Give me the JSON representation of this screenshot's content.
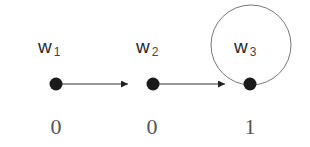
{
  "diagram": {
    "type": "kripke-frame",
    "worlds": [
      {
        "id": "w1",
        "base": "w",
        "sub": "1",
        "value": "0",
        "x": 56,
        "y": 84
      },
      {
        "id": "w2",
        "base": "w",
        "sub": "2",
        "value": "0",
        "x": 153,
        "y": 84
      },
      {
        "id": "w3",
        "base": "w",
        "sub": "3",
        "value": "1",
        "x": 250,
        "y": 84
      }
    ],
    "edges": [
      {
        "from": "w1",
        "to": "w2"
      },
      {
        "from": "w2",
        "to": "w3"
      },
      {
        "from": "w3",
        "to": "w3",
        "kind": "reflexive-loop"
      }
    ],
    "colors": {
      "node": "#1a1a1a",
      "edge": "#333333",
      "loop": "#777777",
      "label": "#2a2a2a",
      "value": "#555555"
    }
  }
}
